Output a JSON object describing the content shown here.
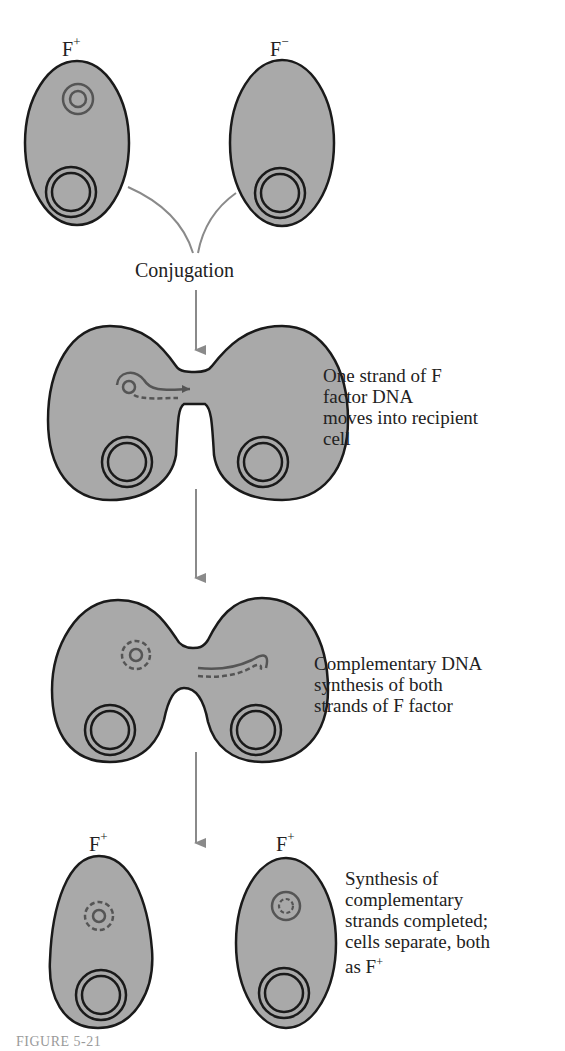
{
  "figure": {
    "caption": "FIGURE 5-21",
    "colors": {
      "cell_fill": "#a9a9a9",
      "cell_stroke": "#1a1a1a",
      "plasmid_stroke": "#555555",
      "arrow": "#8a8a8a",
      "text": "#222222",
      "caption": "#9a9a9a"
    }
  },
  "stage1": {
    "left_cell": {
      "label": "F",
      "sup": "+"
    },
    "right_cell": {
      "label": "F",
      "sup": "−"
    },
    "process_label": "Conjugation"
  },
  "stage2": {
    "description": [
      "One strand of F",
      "factor DNA",
      "moves into recipient",
      "cell"
    ]
  },
  "stage3": {
    "description": [
      "Complementary DNA",
      "synthesis of both",
      "strands of F factor"
    ]
  },
  "stage4": {
    "left_cell": {
      "label": "F",
      "sup": "+"
    },
    "right_cell": {
      "label": "F",
      "sup": "+"
    },
    "description": [
      "Synthesis of",
      "complementary",
      "strands completed;",
      "cells separate, both",
      "as F"
    ],
    "description_sup": "+"
  }
}
